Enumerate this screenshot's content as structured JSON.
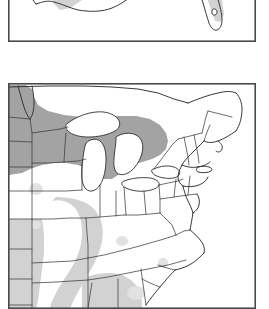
{
  "figure": {
    "background_color": "#ffffff",
    "width_px": 269,
    "height_px": 294,
    "panel_count": 2
  },
  "legend_shades": {
    "dark_gray": "#a3a3a3",
    "light_gray": "#d2d2d2",
    "faint_gray": "#e2e2e2",
    "unshaded": "#ffffff",
    "border_color": "#3b3b3b",
    "frame_color": "#4a4a4a"
  },
  "panels": [
    {
      "id": "panel-top",
      "name": "southeast-gulf-coast-map",
      "region": "Southern United States, Gulf Coast and Florida",
      "clipped_edge": "top",
      "frame_visible": true,
      "features": [
        "Texas Gulf coastline",
        "Louisiana delta",
        "Mississippi",
        "Alabama",
        "Georgia",
        "Florida peninsula",
        "Gulf of Mexico"
      ],
      "shaded_areas": [
        {
          "label": "east Texas to Louisiana band",
          "shade": "light_gray"
        },
        {
          "label": "Florida peninsula",
          "shade": "light_gray"
        },
        {
          "label": "Mississippi and Alabama interior",
          "shade": "light_gray"
        }
      ]
    },
    {
      "id": "panel-bottom",
      "name": "northeast-midwest-map",
      "region": "Upper Midwest, Great Lakes and Northeastern United States",
      "clipped_edge": "bottom",
      "frame_visible": true,
      "features": [
        "Lake Superior",
        "Lake Michigan",
        "Lake Huron",
        "Lake Erie",
        "Lake Ontario",
        "Minnesota",
        "Wisconsin",
        "Michigan",
        "North Dakota",
        "South Dakota",
        "Nebraska",
        "Kansas",
        "Oklahoma",
        "Iowa",
        "Missouri",
        "Arkansas",
        "Illinois",
        "Indiana",
        "Ohio",
        "Kentucky",
        "Tennessee",
        "Pennsylvania",
        "New York",
        "New England",
        "Maine",
        "Virginia",
        "North Carolina",
        "South Carolina",
        "Georgia",
        "Atlantic coastline"
      ],
      "shaded_areas": [
        {
          "label": "northern plains to Great Lakes band",
          "shade": "dark_gray"
        },
        {
          "label": "central plains Kansas Oklahoma",
          "shade": "light_gray"
        },
        {
          "label": "Missouri Arkansas corridor",
          "shade": "light_gray"
        },
        {
          "label": "lower Mississippi valley",
          "shade": "light_gray"
        },
        {
          "label": "scattered interior patches",
          "shade": "faint_gray"
        }
      ]
    }
  ]
}
